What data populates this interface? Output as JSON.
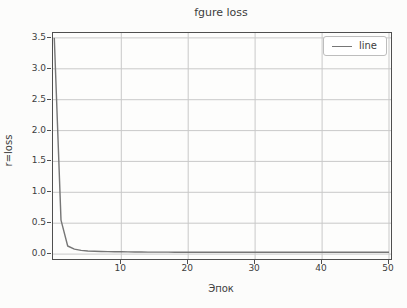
{
  "figure": {
    "title": "fgure loss",
    "xlabel": "Эпок",
    "ylabel": "r=loss",
    "legend": {
      "position": "upper right",
      "entries": [
        {
          "label": "line",
          "color": "#767676"
        }
      ]
    },
    "colors": {
      "background": "#fcfcfb",
      "spine": "#4f4f4f",
      "grid": "#c9c9c9",
      "line": "#767676",
      "text": "#3d3d3d"
    }
  },
  "chart_data": {
    "type": "line",
    "title": "fgure loss",
    "xlabel": "Эпок",
    "ylabel": "r=loss",
    "grid": true,
    "legend_position": "upper right",
    "xlim": [
      -0.2,
      50.3
    ],
    "ylim": [
      -0.08,
      3.58
    ],
    "xticks": [
      10,
      20,
      30,
      40,
      50
    ],
    "yticks": [
      0,
      0.5,
      1,
      1.5,
      2,
      2.5,
      3,
      3.5
    ],
    "xticklabels": [
      "10",
      "20",
      "30",
      "40",
      "50"
    ],
    "yticklabels": [
      "0.0",
      "0.5",
      "1.0",
      "1.5",
      "2.0",
      "2.5",
      "3.0",
      "3.5"
    ],
    "series": [
      {
        "name": "line",
        "x": [
          0,
          1,
          2,
          3,
          4,
          5,
          6,
          7,
          8,
          9,
          10,
          11,
          12,
          13,
          14,
          15,
          16,
          17,
          18,
          19,
          20,
          21,
          22,
          23,
          24,
          25,
          26,
          27,
          28,
          29,
          30,
          31,
          32,
          33,
          34,
          35,
          36,
          37,
          38,
          39,
          40,
          41,
          42,
          43,
          44,
          45,
          46,
          47,
          48,
          49,
          50
        ],
        "y": [
          3.5,
          0.55,
          0.13,
          0.08,
          0.06,
          0.05,
          0.045,
          0.042,
          0.04,
          0.038,
          0.036,
          0.035,
          0.034,
          0.033,
          0.032,
          0.032,
          0.031,
          0.031,
          0.03,
          0.03,
          0.03,
          0.03,
          0.03,
          0.03,
          0.03,
          0.03,
          0.03,
          0.03,
          0.03,
          0.03,
          0.03,
          0.03,
          0.03,
          0.03,
          0.03,
          0.03,
          0.03,
          0.03,
          0.03,
          0.03,
          0.03,
          0.03,
          0.03,
          0.03,
          0.03,
          0.03,
          0.03,
          0.03,
          0.03,
          0.03,
          0.03
        ]
      }
    ]
  }
}
